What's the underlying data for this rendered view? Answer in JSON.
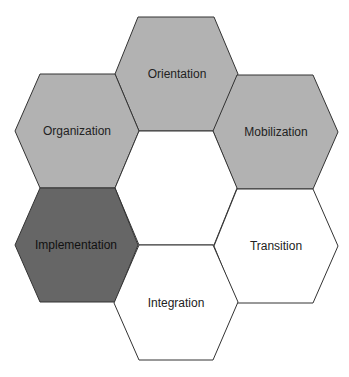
{
  "diagram": {
    "type": "hexagon-cluster",
    "hexagons": [
      {
        "id": "orientation",
        "label": "Orientation",
        "fill": "#b2b2b2",
        "points": "138,17 214,17 238,74 214,131 139,131 115,74",
        "label_x": 177,
        "label_y": 78
      },
      {
        "id": "organization",
        "label": "Organization",
        "fill": "#b2b2b2",
        "points": "40,74 115,74 139,131 115,188 40,188 15,131",
        "label_x": 77,
        "label_y": 135
      },
      {
        "id": "mobilization",
        "label": "Mobilization",
        "fill": "#b2b2b2",
        "points": "237,75 313,75 338,132 313,189 237,189 213,131",
        "label_x": 276,
        "label_y": 136
      },
      {
        "id": "center",
        "label": "",
        "fill": "#ffffff",
        "points": "139,131 213,131 237,188 214,245 139,245 115,188",
        "label_x": 176,
        "label_y": 192
      },
      {
        "id": "implementation",
        "label": "Implementation",
        "fill": "#666666",
        "points": "40,188 115,188 138,245 115,302 40,302 15,245",
        "label_x": 76,
        "label_y": 249
      },
      {
        "id": "transition",
        "label": "Transition",
        "fill": "#ffffff",
        "points": "237,189 313,189 338,246 313,303 237,303 214,246",
        "label_x": 276,
        "label_y": 250
      },
      {
        "id": "integration",
        "label": "Integration",
        "fill": "#ffffff",
        "points": "139,245 213,245 238,302 213,360 139,360 114,303",
        "label_x": 176,
        "label_y": 307
      }
    ],
    "stroke_color": "#333333"
  }
}
